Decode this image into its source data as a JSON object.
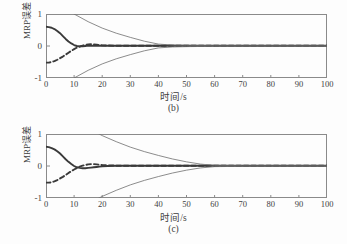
{
  "figure": {
    "background_color": "#fdfdfd",
    "axis_color": "#8a8a8a",
    "curve_color": "#3a3a3a",
    "envelope_color": "#6e6e6e"
  },
  "chart_data": [
    {
      "type": "line",
      "panel_id": "b",
      "caption": "(b)",
      "title": "",
      "xlabel": "时间/s",
      "ylabel": "MRP误差",
      "xlim": [
        0,
        100
      ],
      "ylim": [
        -1,
        1
      ],
      "xticks": [
        0,
        10,
        20,
        30,
        40,
        50,
        60,
        70,
        80,
        90,
        100
      ],
      "xticklabels": [
        "0",
        "10",
        "20",
        "30",
        "40",
        "50",
        "60",
        "70",
        "80",
        "90",
        "100"
      ],
      "yticks": [
        -1,
        0,
        1
      ],
      "yticklabels": [
        "-1",
        "0",
        "1"
      ],
      "grid": false,
      "legend": "none",
      "settling_time_s": 40,
      "series": [
        {
          "name": "MRP error solid",
          "style": "solid",
          "x": [
            0,
            1,
            2,
            3,
            4,
            5,
            6,
            7,
            8,
            9,
            10,
            11,
            12,
            13,
            14,
            15,
            16,
            17,
            18,
            20,
            24,
            30,
            40,
            50,
            60,
            70,
            80,
            90,
            100
          ],
          "y": [
            0.6,
            0.59,
            0.57,
            0.53,
            0.47,
            0.4,
            0.31,
            0.22,
            0.14,
            0.08,
            0.03,
            0.0,
            -0.01,
            -0.01,
            0.0,
            0.01,
            0.01,
            0.01,
            0.01,
            0.01,
            0.01,
            0.01,
            0.01,
            0.01,
            0.01,
            0.01,
            0.01,
            0.01,
            0.01
          ]
        },
        {
          "name": "MRP error dashed",
          "style": "dashed",
          "x": [
            0,
            1,
            2,
            3,
            4,
            5,
            6,
            7,
            8,
            9,
            10,
            11,
            12,
            13,
            14,
            15,
            16,
            17,
            18,
            19,
            20,
            24,
            30,
            40,
            50,
            60,
            70,
            80,
            90,
            100
          ],
          "y": [
            -0.52,
            -0.52,
            -0.5,
            -0.47,
            -0.43,
            -0.38,
            -0.33,
            -0.27,
            -0.21,
            -0.15,
            -0.1,
            -0.05,
            -0.02,
            0.01,
            0.04,
            0.05,
            0.06,
            0.05,
            0.04,
            0.03,
            0.02,
            0.01,
            0.01,
            0.01,
            0.01,
            0.01,
            0.01,
            0.01,
            0.01,
            0.01
          ]
        },
        {
          "name": "upper envelope",
          "style": "solid-thin",
          "x": [
            0,
            5,
            10,
            15,
            20,
            25,
            30,
            35,
            40,
            45,
            50,
            60,
            70,
            80,
            90,
            100
          ],
          "y": [
            1.62,
            1.3,
            1.0,
            0.76,
            0.56,
            0.4,
            0.27,
            0.15,
            0.06,
            0.03,
            0.02,
            0.01,
            0.01,
            0.01,
            0.01,
            0.01
          ]
        },
        {
          "name": "lower envelope",
          "style": "solid-thin",
          "x": [
            0,
            5,
            10,
            15,
            20,
            25,
            30,
            35,
            40,
            45,
            50,
            60,
            70,
            80,
            90,
            100
          ],
          "y": [
            -1.62,
            -1.3,
            -1.0,
            -0.76,
            -0.56,
            -0.4,
            -0.27,
            -0.15,
            -0.06,
            -0.03,
            -0.02,
            -0.01,
            -0.01,
            -0.01,
            -0.01,
            -0.01
          ]
        }
      ]
    },
    {
      "type": "line",
      "panel_id": "c",
      "caption": "(c)",
      "title": "",
      "xlabel": "时间/s",
      "ylabel": "MRP误差",
      "xlim": [
        0,
        100
      ],
      "ylim": [
        -1,
        1
      ],
      "xticks": [
        0,
        10,
        20,
        30,
        40,
        50,
        60,
        70,
        80,
        90,
        100
      ],
      "xticklabels": [
        "0",
        "10",
        "20",
        "30",
        "40",
        "50",
        "60",
        "70",
        "80",
        "90",
        "100"
      ],
      "yticks": [
        -1,
        0,
        1
      ],
      "yticklabels": [
        "-1",
        "0",
        "1"
      ],
      "grid": false,
      "legend": "none",
      "settling_time_s": 60,
      "series": [
        {
          "name": "MRP error solid",
          "style": "solid",
          "x": [
            0,
            1,
            2,
            3,
            4,
            5,
            6,
            7,
            8,
            9,
            10,
            11,
            12,
            13,
            14,
            15,
            16,
            17,
            18,
            19,
            20,
            22,
            25,
            30,
            40,
            50,
            60,
            70,
            80,
            90,
            100
          ],
          "y": [
            0.6,
            0.59,
            0.56,
            0.52,
            0.46,
            0.39,
            0.3,
            0.21,
            0.13,
            0.06,
            0.0,
            -0.04,
            -0.06,
            -0.07,
            -0.07,
            -0.06,
            -0.05,
            -0.04,
            -0.03,
            -0.02,
            -0.01,
            0.0,
            0.01,
            0.01,
            0.01,
            0.01,
            0.01,
            0.01,
            0.01,
            0.01,
            0.01
          ]
        },
        {
          "name": "MRP error dashed",
          "style": "dashed",
          "x": [
            0,
            1,
            2,
            3,
            4,
            5,
            6,
            7,
            8,
            9,
            10,
            11,
            12,
            13,
            14,
            15,
            16,
            17,
            18,
            19,
            20,
            22,
            25,
            30,
            40,
            50,
            60,
            70,
            80,
            90,
            100
          ],
          "y": [
            -0.52,
            -0.52,
            -0.51,
            -0.48,
            -0.44,
            -0.39,
            -0.34,
            -0.28,
            -0.22,
            -0.16,
            -0.11,
            -0.06,
            -0.02,
            0.01,
            0.03,
            0.05,
            0.06,
            0.06,
            0.05,
            0.04,
            0.03,
            0.02,
            0.01,
            0.01,
            0.01,
            0.01,
            0.01,
            0.01,
            0.01,
            0.01,
            0.01
          ]
        },
        {
          "name": "upper envelope",
          "style": "solid-thin",
          "x": [
            0,
            5,
            10,
            15,
            20,
            25,
            30,
            35,
            40,
            45,
            50,
            55,
            60,
            70,
            80,
            90,
            100
          ],
          "y": [
            2.1,
            1.75,
            1.45,
            1.18,
            0.95,
            0.76,
            0.59,
            0.45,
            0.33,
            0.22,
            0.13,
            0.06,
            0.02,
            0.01,
            0.01,
            0.01,
            0.01
          ]
        },
        {
          "name": "lower envelope",
          "style": "solid-thin",
          "x": [
            0,
            5,
            10,
            15,
            20,
            25,
            30,
            35,
            40,
            45,
            50,
            55,
            60,
            70,
            80,
            90,
            100
          ],
          "y": [
            -2.1,
            -1.75,
            -1.45,
            -1.18,
            -0.95,
            -0.76,
            -0.59,
            -0.45,
            -0.33,
            -0.22,
            -0.13,
            -0.06,
            -0.02,
            -0.01,
            -0.01,
            -0.01,
            -0.01
          ]
        }
      ]
    }
  ]
}
